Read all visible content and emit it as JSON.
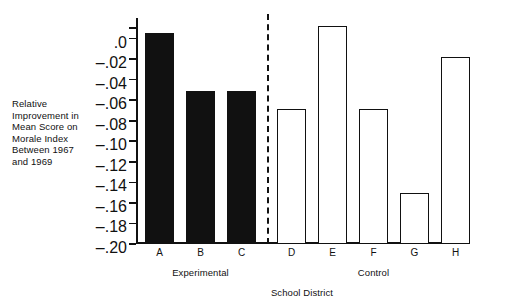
{
  "chart_data": {
    "type": "bar",
    "title": "",
    "categories": [
      "A",
      "B",
      "C",
      "D",
      "E",
      "F",
      "G",
      "H"
    ],
    "values": [
      0.005,
      -0.051,
      -0.051,
      -0.069,
      0.012,
      -0.069,
      -0.15,
      -0.018
    ],
    "series": [
      {
        "name": "Relative Improvement",
        "values": [
          0.005,
          -0.051,
          -0.051,
          -0.069,
          0.012,
          -0.069,
          -0.15,
          -0.018
        ]
      }
    ],
    "bar_styles": [
      "filled",
      "filled",
      "filled",
      "open",
      "open",
      "open",
      "open",
      "open"
    ],
    "groups": [
      {
        "label": "Experimental",
        "categories": [
          "A",
          "B",
          "C"
        ]
      },
      {
        "label": "Control",
        "categories": [
          "D",
          "E",
          "F",
          "G",
          "H"
        ]
      }
    ],
    "xlabel": "School District",
    "ylabel": "Relative Improvement in Mean Score on Morale Index Between 1967 and 1969",
    "ylabel_lines": [
      "Relative",
      "Improvement in",
      "Mean Score on",
      "Morale Index",
      "Between 1967",
      "and 1969"
    ],
    "ylim": [
      -0.2,
      0.02
    ],
    "yticks": [
      0.0,
      -0.02,
      -0.04,
      -0.06,
      -0.08,
      -0.1,
      -0.12,
      -0.14,
      -0.16,
      -0.18,
      -0.2
    ],
    "ytick_labels": [
      ".0",
      "–.02",
      "–.04",
      "–.06",
      "–.08",
      "–.10",
      "–.12",
      "–.14",
      "–.16",
      "–.18",
      "–.20"
    ],
    "grid": false,
    "legend": "none",
    "divider": {
      "between": [
        "C",
        "D"
      ],
      "style": "dashed",
      "color": "#111111"
    },
    "colors": {
      "filled_bar": "#111111",
      "open_bar_fill": "#ffffff",
      "open_bar_stroke": "#111111",
      "axis": "#111111",
      "background": "#ffffff"
    }
  }
}
